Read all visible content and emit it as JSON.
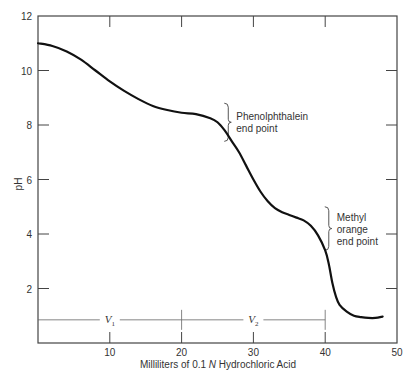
{
  "chart_data": {
    "type": "line",
    "title": "",
    "xlabel": "Milliliters of 0.1 N Hydrochloric Acid",
    "xlabel_parts": [
      "Milliliters of 0.1 ",
      "N",
      " Hydrochloric Acid"
    ],
    "ylabel": "pH",
    "xlim": [
      0,
      50
    ],
    "ylim": [
      0,
      12
    ],
    "x_ticks": [
      10,
      20,
      30,
      40,
      50
    ],
    "y_ticks": [
      2,
      4,
      6,
      8,
      10,
      12
    ],
    "grid": false,
    "legend": null,
    "series": [
      {
        "name": "Titration curve",
        "x": [
          0,
          2,
          4,
          6,
          8,
          10,
          12,
          14,
          16,
          18,
          20,
          22,
          24,
          25,
          26,
          27,
          28,
          29,
          30,
          31,
          32,
          33,
          34,
          35,
          36,
          37,
          38,
          39,
          40,
          40.5,
          41,
          41.5,
          42,
          43,
          44,
          45,
          46,
          47,
          48
        ],
        "y": [
          11.0,
          10.9,
          10.7,
          10.4,
          10.0,
          9.6,
          9.25,
          8.95,
          8.7,
          8.55,
          8.45,
          8.4,
          8.25,
          8.1,
          7.8,
          7.4,
          7.0,
          6.5,
          6.0,
          5.55,
          5.2,
          4.95,
          4.8,
          4.7,
          4.6,
          4.5,
          4.3,
          3.95,
          3.4,
          2.9,
          2.2,
          1.7,
          1.4,
          1.15,
          1.0,
          0.95,
          0.92,
          0.92,
          0.97
        ]
      }
    ],
    "annotations": [
      {
        "text": "Phenolphthalein end point",
        "lines": [
          "Phenolphthalein",
          "end point"
        ],
        "bracket_y_range": [
          7.4,
          8.8
        ],
        "x": 26.5
      },
      {
        "text": "Methyl orange end point",
        "lines": [
          "Methyl",
          "orange",
          "end point"
        ],
        "bracket_y_range": [
          3.4,
          5.0
        ],
        "x": 40.5
      },
      {
        "text": "V1",
        "base": "V",
        "sub": "1",
        "span": [
          0,
          20
        ],
        "y": 0.85
      },
      {
        "text": "V2",
        "base": "V",
        "sub": "2",
        "span": [
          20,
          40
        ],
        "y": 0.85
      }
    ]
  }
}
